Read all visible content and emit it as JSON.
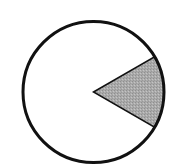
{
  "diagram": {
    "type": "circle-with-shaded-sector",
    "circle": {
      "cx": 93.5,
      "cy": 92,
      "r": 70.5,
      "stroke": "#111111",
      "stroke_width": 3,
      "fill": "#ffffff"
    },
    "sector": {
      "start_angle_deg": -30,
      "end_angle_deg": 30,
      "central_angle_deg": 60,
      "fraction_of_circle": "1/6",
      "fill": "#a9a9a9",
      "stroke": "#111111",
      "stroke_width": 1.5
    }
  }
}
